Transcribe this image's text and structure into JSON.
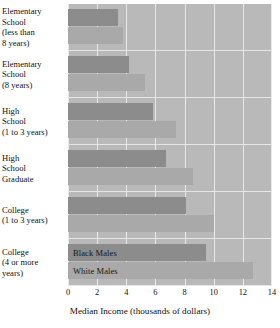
{
  "chart_data": {
    "type": "bar",
    "orientation": "horizontal",
    "title": "",
    "xlabel": "Median Income (thousands of dollars)",
    "ylabel": "",
    "xlim": [
      0,
      14
    ],
    "xticks": [
      0,
      2,
      4,
      6,
      8,
      10,
      12,
      14
    ],
    "xtick_labels": [
      "0",
      "2",
      "4",
      "6",
      "8",
      "10",
      "12",
      "14"
    ],
    "grid": true,
    "legend_position": "inside-bottom-bars",
    "categories": [
      "Elementary School (less than 8 years)",
      "Elementary School (8 years)",
      "High School (1 to 3 years)",
      "High School Graduate",
      "College (1 to 3 years)",
      "College (4 or more years)"
    ],
    "category_label_lines": [
      [
        "Elementary",
        "School",
        "(less than",
        "8 years)"
      ],
      [
        "Elementary",
        "School",
        "(8 years)"
      ],
      [
        "High",
        "School",
        "(1 to 3 years)"
      ],
      [
        "High",
        "School",
        "Graduate"
      ],
      [
        "College",
        "(1 to 3 years)"
      ],
      [
        "College",
        "(4 or more",
        "years)"
      ]
    ],
    "series": [
      {
        "name": "Black Males",
        "color": "#8c8c8c",
        "values": [
          3.4,
          4.2,
          5.8,
          6.7,
          8.1,
          9.5
        ]
      },
      {
        "name": "White Males",
        "color": "#a9a9a9",
        "values": [
          3.8,
          5.3,
          7.4,
          8.6,
          10.0,
          12.7
        ]
      }
    ]
  },
  "legend": {
    "black_males": "Black Males",
    "white_males": "White Males"
  },
  "colors": {
    "plot_background": "#b9b9b9",
    "gridline": "#e8e8e8",
    "black_males_bar": "#8c8c8c",
    "white_males_bar": "#a9a9a9",
    "page_background": "#ffffff",
    "text": "#111111"
  }
}
